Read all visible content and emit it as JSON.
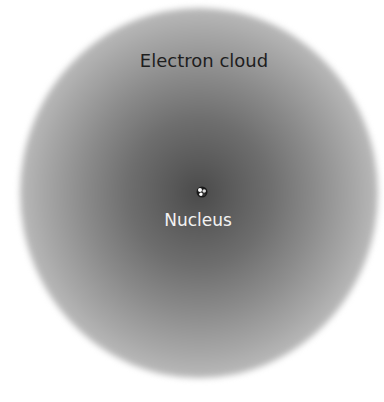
{
  "diagram": {
    "labels": {
      "electron_cloud": "Electron cloud",
      "nucleus": "Nucleus"
    },
    "colors": {
      "cloud_center": "#4a4a4a",
      "cloud_edge": "#e6e6e6",
      "background": "#ffffff",
      "cloud_label": "#1e1e1e",
      "nucleus_label": "#f2f2f2"
    }
  }
}
